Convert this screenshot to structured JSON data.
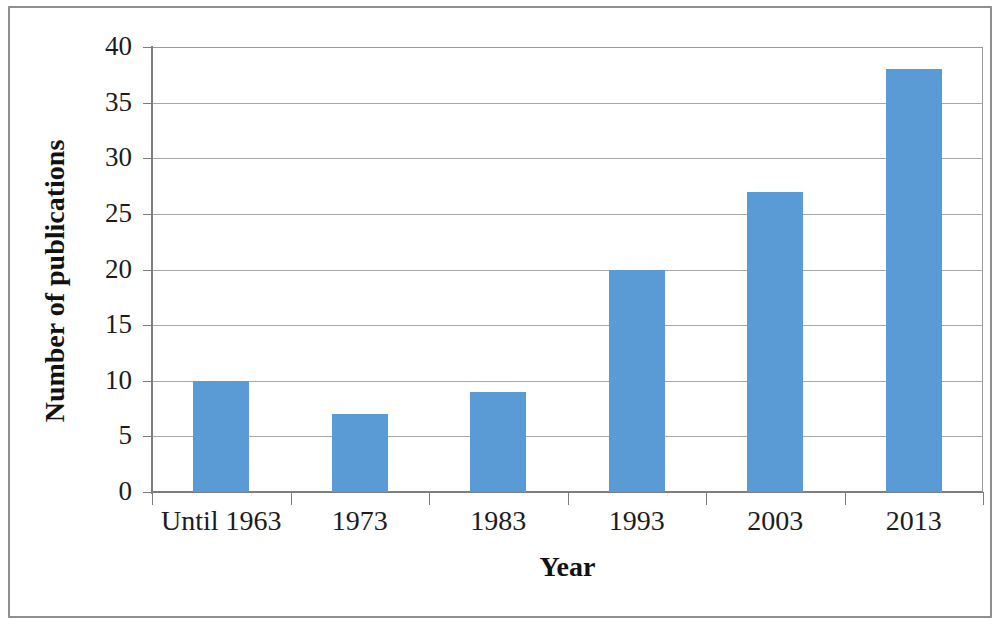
{
  "chart_data": {
    "type": "bar",
    "title": "",
    "subtitle": "",
    "xlabel": "Year",
    "ylabel": "Number of publications",
    "categories": [
      "Until 1963",
      "1973",
      "1983",
      "1993",
      "2003",
      "2013"
    ],
    "values": [
      10,
      7,
      9,
      20,
      27,
      38
    ],
    "series": [
      {
        "name": "Number of publications",
        "values": [
          10,
          7,
          9,
          20,
          27,
          38
        ]
      }
    ],
    "ylim": [
      0,
      40
    ],
    "y_ticks": [
      0,
      5,
      10,
      15,
      20,
      25,
      30,
      35,
      40
    ],
    "y_tick_labels": [
      "0",
      "5",
      "10",
      "15",
      "20",
      "25",
      "30",
      "35",
      "40"
    ],
    "grid": true,
    "grid_axis": "y",
    "legend": false,
    "legend_position": "none",
    "bar_color": "#5b9bd5",
    "gridline_color": "#a8a8a8",
    "axis_color": "#7d7d7d",
    "text_color": "#1c1c1c",
    "background_color": "#ffffff",
    "frame_color": "#8f8f8f",
    "annotations": []
  }
}
